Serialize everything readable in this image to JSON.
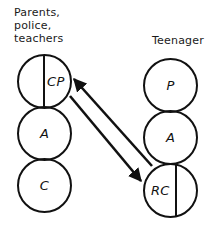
{
  "diagram": {
    "title_left": "Parents,\npolice,\nteachers",
    "title_right": "Teenager",
    "stroke_color": "#111111",
    "text_color": "#1a1a1a",
    "background": "#ffffff",
    "left_column": {
      "heading": "Parents,\npolice,\nteachers",
      "states": [
        {
          "label": "CP",
          "split": true,
          "name": "critical-parent"
        },
        {
          "label": "A",
          "split": false,
          "name": "adult"
        },
        {
          "label": "C",
          "split": false,
          "name": "child"
        }
      ]
    },
    "right_column": {
      "heading": "Teenager",
      "states": [
        {
          "label": "P",
          "split": false,
          "name": "parent"
        },
        {
          "label": "A",
          "split": false,
          "name": "adult"
        },
        {
          "label": "RC",
          "split": true,
          "name": "rebellious-child"
        }
      ]
    },
    "arrows": [
      {
        "name": "arrow-rc-to-cp",
        "direction": "up-left",
        "from": "RC",
        "to": "CP"
      },
      {
        "name": "arrow-cp-to-rc",
        "direction": "down-right",
        "from": "CP",
        "to": "RC"
      }
    ]
  }
}
